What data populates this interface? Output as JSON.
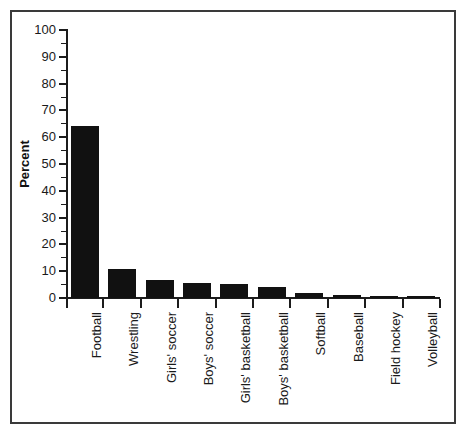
{
  "chart_data": {
    "type": "bar",
    "title": "",
    "xlabel": "",
    "ylabel": "Percent",
    "ylim": [
      0,
      100
    ],
    "ytick_values": [
      0,
      10,
      20,
      30,
      40,
      50,
      60,
      70,
      80,
      90,
      100
    ],
    "ytick_labels": [
      "0",
      "10",
      "20",
      "30",
      "40",
      "50",
      "60",
      "70",
      "80",
      "90",
      "100"
    ],
    "yminor_values": [
      5,
      15,
      25,
      35,
      45,
      55,
      65,
      75,
      85,
      95
    ],
    "grid": false,
    "legend": null,
    "bar_color": "#111111",
    "categories": [
      "Football",
      "Wrestling",
      "Girls' soccer",
      "Boys' soccer",
      "Girls' basketball",
      "Boys' basketball",
      "Softball",
      "Baseball",
      "Field hockey",
      "Volleyball"
    ],
    "values": [
      64.0,
      10.8,
      6.7,
      5.7,
      5.2,
      4.0,
      1.7,
      1.1,
      0.9,
      0.4
    ]
  }
}
